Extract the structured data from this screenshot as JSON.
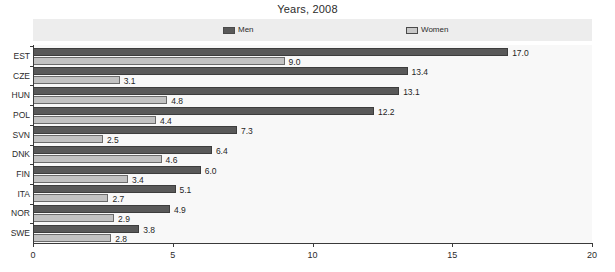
{
  "chart_data": {
    "type": "bar",
    "orientation": "horizontal",
    "title": "Years, 2008",
    "xlabel": "",
    "ylabel": "",
    "xlim": [
      0,
      20
    ],
    "xticks": [
      0,
      5,
      10,
      15,
      20
    ],
    "xtick_labels": [
      "0",
      "5",
      "10",
      "15",
      "20"
    ],
    "grid": false,
    "legend_position": "top",
    "categories": [
      "EST",
      "CZE",
      "HUN",
      "POL",
      "SVN",
      "DNK",
      "FIN",
      "ITA",
      "NOR",
      "SWE"
    ],
    "series": [
      {
        "name": "Men",
        "color": "#595959",
        "values": [
          17.0,
          13.4,
          13.1,
          12.2,
          7.3,
          6.4,
          6.0,
          5.1,
          4.9,
          3.8
        ],
        "labels": [
          "17.0",
          "13.4",
          "13.1",
          "12.2",
          "7.3",
          "6.4",
          "6.0",
          "5.1",
          "4.9",
          "3.8"
        ]
      },
      {
        "name": "Women",
        "color": "#c2c2c2",
        "values": [
          9.0,
          3.1,
          4.8,
          4.4,
          2.5,
          4.6,
          3.4,
          2.7,
          2.9,
          2.8
        ],
        "labels": [
          "9.0",
          "3.1",
          "4.8",
          "4.4",
          "2.5",
          "4.6",
          "3.4",
          "2.7",
          "2.9",
          "2.8"
        ]
      }
    ]
  },
  "legend": {
    "items": [
      {
        "label": "Men",
        "swatch": "men-swatch"
      },
      {
        "label": "Women",
        "swatch": "women-swatch"
      }
    ]
  },
  "colors": {
    "men": "#595959",
    "women": "#c2c2c2",
    "legend_band": "#ededed",
    "plot_background": "#f8f8f8",
    "axis": "#3a3a3a",
    "text": "#2b2b2b"
  }
}
